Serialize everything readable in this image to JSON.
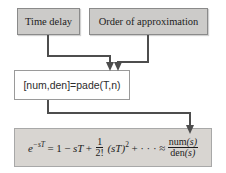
{
  "diagram": {
    "boxes": {
      "time_delay": {
        "label": "Time delay"
      },
      "order_of_approximation": {
        "label": "Order of approximation"
      },
      "pade_command": {
        "code": "[num,den]=pade(T,n)"
      }
    },
    "formula": {
      "base": "e",
      "exponent": "−sT",
      "equals": "=",
      "term1": "1",
      "minus": "−",
      "term2": "sT",
      "plus1": "+",
      "frac1": {
        "num": "1",
        "den": "2!"
      },
      "term3_base": "(sT)",
      "term3_exp": "2",
      "plus2": "+",
      "ellipsis": "· · ·",
      "approx": "≈",
      "frac2": {
        "num_name": "num",
        "num_arg": "(s)",
        "den_name": "den",
        "den_arg": "(s)"
      }
    }
  },
  "colors": {
    "background": "#ffffff",
    "text": "#1c1c1c",
    "box_fill": "#cccbc9",
    "box_border": "#8a8a8a",
    "pade_fill": "#ffffff",
    "pade_border": "#9a9a9a",
    "formula_fill": "#d8d5d1",
    "formula_border": "#a8a8a8",
    "connector": "#4d4d4d"
  }
}
